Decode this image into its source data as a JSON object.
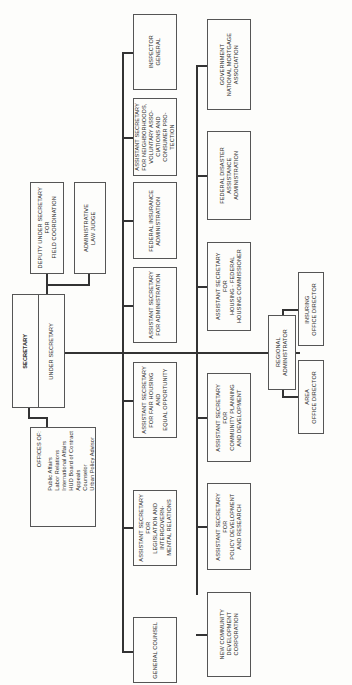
{
  "chart": {
    "secretary": "SECRETARY",
    "under_secretary": "UNDER SECRETARY",
    "deputy_under_secretary": "DEPUTY UNDER SECRETARY\nFOR\nFIELD COORDINATION",
    "administrative_law_judge": "ADMINISTRATIVE\nLAW JUDGE",
    "offices": {
      "heading": "OFFICES OF:",
      "items": "Public Affairs\nLabor Relations\nInternational Affairs\nHUD Board of Contract\n   Appeals\nCounselor\nUrban Policy Advisor"
    },
    "top_row": [
      "INSPECTOR\nGENERAL",
      "ASSISTANT SECRETARY\nFOR NEIGHBORHOODS,\nVOLUNTARY ASSO-\nCIATIONS AND\nCONSUMER PRO-\nTECTION",
      "FEDERAL INSURANCE\nADMINISTRATION",
      "ASSISTANT SECRETARY\nFOR ADMINISTRATION",
      "ASSISTANT SECRETARY\nFOR FAIR HOUSING\nAND\nEQUAL OPPORTUNITY",
      "ASSISTANT SECRETARY\nFOR\nLEGISLATION AND\nINTERGOVERN-\nMENTAL RELATIONS",
      "GENERAL COUNSEL"
    ],
    "bottom_row": [
      "GOVERNMENT\nNATIONAL MORTGAGE\nASSOCIATION",
      "FEDERAL DISASTER\nASSISTANCE\nADMINISTRATION",
      "ASSISTANT SECRETARY\nFOR\nHOUSING - FEDERAL\nHOUSING COMMISSIONER",
      "ASSISTANT SECRETARY\nFOR\nCOMMUNITY PLANNING\nAND DEVELOPMENT",
      "ASSISTANT SECRETARY\nFOR\nPOLICY DEVELOPMENT\nAND RESEARCH",
      "NEW COMMUNITY\nDEVELOPMENT\nCORPORATION"
    ],
    "regional_administrator": "REGIONAL\nADMINISTRATOR",
    "insuring_office_director": "INSURING\nOFFICE DIRECTOR",
    "area_office_director": "AREA\nOFFICE DIRECTOR"
  }
}
